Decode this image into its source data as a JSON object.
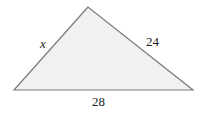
{
  "diagram": {
    "type": "triangle",
    "colors": {
      "fill": "#f1f1f1",
      "stroke": "#7a7a7a",
      "text": "#222222"
    },
    "vertices": {
      "top": [
        88,
        7
      ],
      "bottom_left": [
        14,
        90
      ],
      "bottom_right": [
        193,
        90
      ]
    },
    "sides": [
      {
        "name": "left",
        "label": "x"
      },
      {
        "name": "right",
        "label": "24"
      },
      {
        "name": "base",
        "label": "28"
      }
    ]
  }
}
